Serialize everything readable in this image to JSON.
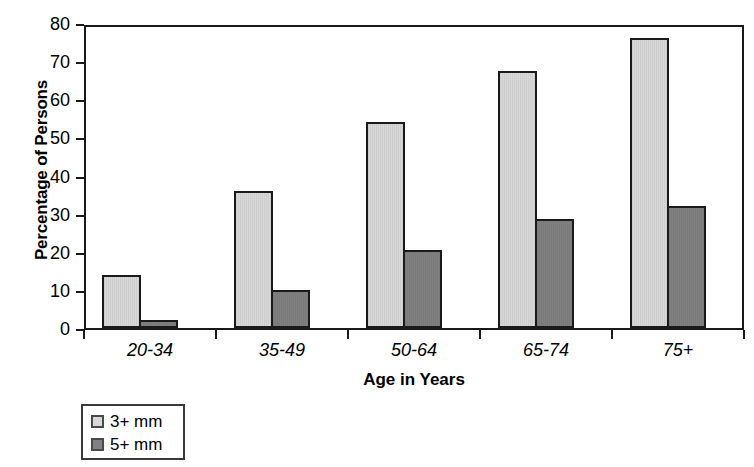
{
  "chart_data": {
    "type": "bar",
    "title": "",
    "xlabel": "Age in Years",
    "ylabel": "Percentage of Persons",
    "categories": [
      "20-34",
      "35-49",
      "50-64",
      "65-74",
      "75+"
    ],
    "series": [
      {
        "name": "3+ mm",
        "color": "#d8d8d8",
        "values": [
          14,
          36,
          54,
          67.5,
          76
        ]
      },
      {
        "name": "5+ mm",
        "color": "#808080",
        "values": [
          2,
          10,
          20.5,
          28.5,
          32
        ]
      }
    ],
    "ylim": [
      0,
      80
    ],
    "yticks": [
      0,
      10,
      20,
      30,
      40,
      50,
      60,
      70,
      80
    ],
    "ytick_labels": [
      "0",
      "10",
      "20",
      "30",
      "40",
      "50",
      "60",
      "70",
      "80"
    ],
    "grid": false,
    "legend_position": "below-left"
  },
  "legend": {
    "entries": [
      {
        "label": "3+ mm",
        "swatch": "light-gray-swatch"
      },
      {
        "label": "5+ mm",
        "swatch": "dark-gray-swatch"
      }
    ]
  }
}
